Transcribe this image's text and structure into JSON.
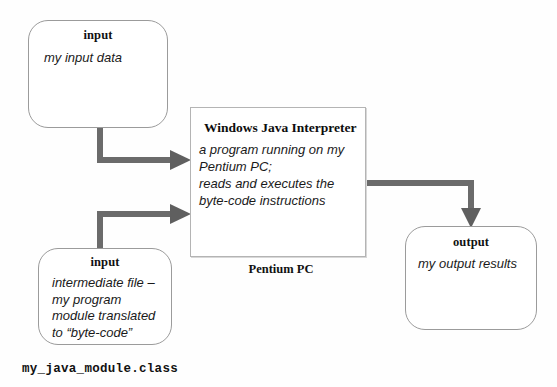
{
  "diagram": {
    "background_color": "#fefefe",
    "arrow_color": "#6b6b6b",
    "box_border_color": "#9b9b9b"
  },
  "nodes": {
    "input_top": {
      "title": "input",
      "body": "my input data"
    },
    "input_bottom": {
      "title": "input",
      "body": "intermediate file – my program module translated to “byte-code”"
    },
    "interpreter": {
      "title": "Windows Java Interpreter",
      "body_line1": "a program running on my",
      "body_line2": "Pentium PC;",
      "body_line3": "reads and executes the",
      "body_line4": "byte-code instructions",
      "caption": "Pentium PC"
    },
    "output": {
      "title": "output",
      "body": "my output results"
    }
  },
  "captions": {
    "class_file": "my_java_module.class"
  },
  "arrows": [
    {
      "name": "arrow-input-top-to-interpreter",
      "from": "input_top",
      "to": "interpreter",
      "shape": "elbow-down-right"
    },
    {
      "name": "arrow-input-bottom-to-interpreter",
      "from": "input_bottom",
      "to": "interpreter",
      "shape": "elbow-up-right"
    },
    {
      "name": "arrow-interpreter-to-output",
      "from": "interpreter",
      "to": "output",
      "shape": "elbow-right-down"
    }
  ]
}
